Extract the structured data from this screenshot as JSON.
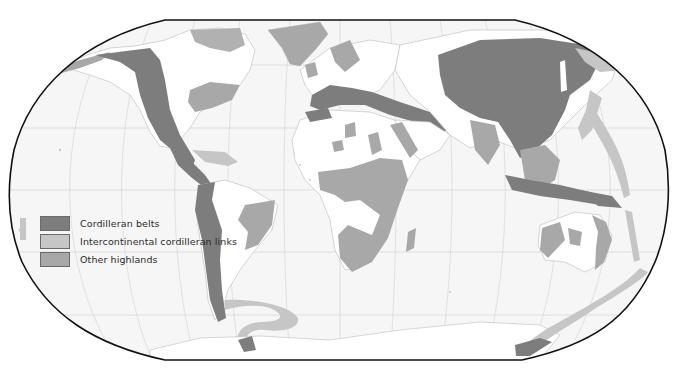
{
  "map": {
    "projection": "Robinson",
    "colors": {
      "ocean": "#f6f6f6",
      "land": "#ffffff",
      "coast": "#b8b8b8",
      "border": "#111111",
      "graticule": "#cfcfcf",
      "cordilleran_belts": "#7d7d7d",
      "intercontinental_links": "#c6c6c6",
      "other_highlands": "#a8a8a8"
    }
  },
  "legend": {
    "items": [
      {
        "label": "Cordilleran belts",
        "color": "#7d7d7d"
      },
      {
        "label": "Intercontinental cordilleran links",
        "color": "#c6c6c6"
      },
      {
        "label": "Other highlands",
        "color": "#a8a8a8"
      }
    ]
  }
}
